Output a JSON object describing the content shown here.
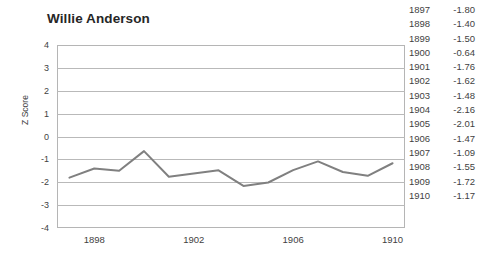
{
  "chart_data": {
    "type": "line",
    "title": "Willie Anderson",
    "xlabel": "",
    "ylabel": "Z Score",
    "x": [
      1897,
      1898,
      1899,
      1900,
      1901,
      1902,
      1903,
      1904,
      1905,
      1906,
      1907,
      1908,
      1909,
      1910
    ],
    "values": [
      -1.8,
      -1.4,
      -1.5,
      -0.64,
      -1.76,
      -1.62,
      -1.48,
      -2.16,
      -2.01,
      -1.47,
      -1.09,
      -1.55,
      -1.72,
      -1.17
    ],
    "ylim": [
      -4,
      4
    ],
    "xlim": [
      1896.5,
      1910.5
    ],
    "y_ticks": [
      "4",
      "3",
      "2",
      "1",
      "0",
      "-1",
      "-2",
      "-3",
      "-4"
    ],
    "y_tick_values": [
      4,
      3,
      2,
      1,
      0,
      -1,
      -2,
      -3,
      -4
    ],
    "x_ticks": [
      "1898",
      "1902",
      "1906",
      "1910"
    ],
    "x_tick_values": [
      1898,
      1902,
      1906,
      1910
    ],
    "grid": true,
    "legend": "none",
    "series_color": "#808080",
    "grid_color": "#b9b9b9",
    "frame_color": "#b5b5b5"
  },
  "data_table": {
    "rows": [
      {
        "year": "1897",
        "value": "-1.80"
      },
      {
        "year": "1898",
        "value": "-1.40"
      },
      {
        "year": "1899",
        "value": "-1.50"
      },
      {
        "year": "1900",
        "value": "-0.64"
      },
      {
        "year": "1901",
        "value": "-1.76"
      },
      {
        "year": "1902",
        "value": "-1.62"
      },
      {
        "year": "1903",
        "value": "-1.48"
      },
      {
        "year": "1904",
        "value": "-2.16"
      },
      {
        "year": "1905",
        "value": "-2.01"
      },
      {
        "year": "1906",
        "value": "-1.47"
      },
      {
        "year": "1907",
        "value": "-1.09"
      },
      {
        "year": "1908",
        "value": "-1.55"
      },
      {
        "year": "1909",
        "value": "-1.72"
      },
      {
        "year": "1910",
        "value": "-1.17"
      }
    ]
  }
}
